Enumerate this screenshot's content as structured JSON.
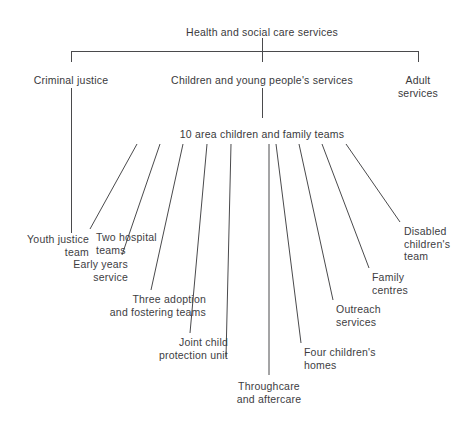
{
  "diagram": {
    "type": "organisational-chart",
    "title": "Health and social care services",
    "stroke_color": "#4a4a4c",
    "text_color": "#3a3a3c",
    "background_color": "#ffffff"
  },
  "root": {
    "label": "Health and social care services",
    "x": 262,
    "y": 26
  },
  "divisions": [
    {
      "name": "criminal-justice",
      "label": "Criminal justice",
      "x": 71,
      "y": 74,
      "align": "center"
    },
    {
      "name": "children-and-young-peoples-services",
      "label": "Children and young people's services",
      "x": 262,
      "y": 74,
      "align": "center"
    },
    {
      "name": "adult-services",
      "label": "Adult services",
      "x": 418,
      "y": 74,
      "align": "center"
    }
  ],
  "area_teams": {
    "name": "area-children-and-family-teams",
    "label": "10 area children and family teams",
    "x": 262,
    "y": 128,
    "align": "center"
  },
  "criminal_justice_child": {
    "name": "youth-justice-team",
    "label": "Youth justice\nteam",
    "x": 89,
    "y": 233,
    "align": "right"
  },
  "leaves": [
    {
      "name": "two-hospital-teams",
      "label": "Two hospital\nteams",
      "x": 96,
      "y": 231,
      "align": "left"
    },
    {
      "name": "early-years-service",
      "label": "Early years\nservice",
      "x": 128,
      "y": 258,
      "align": "right"
    },
    {
      "name": "three-adoption-and-fostering-teams",
      "label": "Three adoption\nand fostering teams",
      "x": 206,
      "y": 293,
      "align": "right"
    },
    {
      "name": "joint-child-protection-unit",
      "label": "Joint child\nprotection unit",
      "x": 228,
      "y": 336,
      "align": "right"
    },
    {
      "name": "throughcare-and-aftercare",
      "label": "Throughcare\nand aftercare",
      "x": 269,
      "y": 380,
      "align": "center"
    },
    {
      "name": "four-childrens-homes",
      "label": "Four children's\nhomes",
      "x": 304,
      "y": 346,
      "align": "left"
    },
    {
      "name": "outreach-services",
      "label": "Outreach\nservices",
      "x": 336,
      "y": 303,
      "align": "left"
    },
    {
      "name": "family-centres",
      "label": "Family\ncentres",
      "x": 372,
      "y": 271,
      "align": "left"
    },
    {
      "name": "disabled-childrens-team",
      "label": "Disabled\nchildren's\nteam",
      "x": 404,
      "y": 225,
      "align": "left"
    }
  ],
  "connectors": {
    "root_drop": {
      "x": 262,
      "y1": 38,
      "y2": 62
    },
    "bus": {
      "x1": 71,
      "x2": 418,
      "y": 51
    },
    "bus_left_tick": {
      "x": 71,
      "y1": 51,
      "y2": 62
    },
    "bus_right_tick": {
      "x": 418,
      "y1": 51,
      "y2": 62
    },
    "centre_drop": {
      "x": 262,
      "y1": 88,
      "y2": 118
    },
    "criminal_drop": {
      "x": 71,
      "y1": 88,
      "y2": 233
    },
    "fan": [
      {
        "name": "fan-line-two-hospital-teams",
        "x1": 137,
        "y1": 144,
        "x2": 90,
        "y2": 229
      },
      {
        "name": "fan-line-early-years-service",
        "x1": 160,
        "y1": 144,
        "x2": 122,
        "y2": 255
      },
      {
        "name": "fan-line-three-adoption-and-fostering",
        "x1": 183,
        "y1": 144,
        "x2": 151,
        "y2": 290
      },
      {
        "name": "fan-line-joint-child-protection-unit",
        "x1": 207,
        "y1": 144,
        "x2": 190,
        "y2": 333
      },
      {
        "name": "fan-line-throughcare-and-aftercare",
        "x1": 231,
        "y1": 144,
        "x2": 226,
        "y2": 357
      },
      {
        "name": "fan-line-centre-vertical",
        "x1": 269,
        "y1": 144,
        "x2": 269,
        "y2": 375
      },
      {
        "name": "fan-line-four-childrens-homes",
        "x1": 276,
        "y1": 144,
        "x2": 301,
        "y2": 343
      },
      {
        "name": "fan-line-outreach-services",
        "x1": 299,
        "y1": 144,
        "x2": 333,
        "y2": 300
      },
      {
        "name": "fan-line-family-centres",
        "x1": 322,
        "y1": 144,
        "x2": 369,
        "y2": 268
      },
      {
        "name": "fan-line-disabled-childrens-team",
        "x1": 346,
        "y1": 144,
        "x2": 400,
        "y2": 222
      }
    ]
  }
}
